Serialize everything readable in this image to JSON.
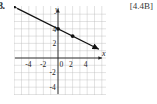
{
  "exercise": {
    "number": "8.",
    "section_tag": "[4.4B]"
  },
  "chart_data": {
    "type": "line",
    "title": "",
    "xlabel": "x",
    "ylabel": "y",
    "xlim": [
      -6,
      6
    ],
    "ylim": [
      -6,
      6
    ],
    "grid": true,
    "grid_step": 1,
    "legend": null,
    "xticks": [
      -4,
      -2,
      0,
      2,
      4
    ],
    "yticks": [
      4,
      2,
      -2,
      -4
    ],
    "xtick_labels": [
      "-4",
      "-2",
      "0",
      "2",
      "4"
    ],
    "ytick_labels": [
      "4",
      "2",
      "-2",
      "-4"
    ],
    "series": [
      {
        "name": "line",
        "equation": "y = -0.5x + 4",
        "slope": -0.5,
        "intercept": 4,
        "x": [
          -5.6,
          5.6
        ],
        "y": [
          6.8,
          1.2
        ],
        "arrow_start": true,
        "arrow_end": true,
        "points": [
          {
            "x": 0,
            "y": 4
          },
          {
            "x": 2,
            "y": 3
          }
        ]
      }
    ]
  },
  "axes": {
    "x_axis_label": "x",
    "y_axis_label": "y"
  }
}
